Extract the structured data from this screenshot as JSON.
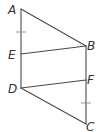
{
  "diagram": {
    "type": "geometry",
    "points": {
      "A": {
        "label": "A",
        "x": 21,
        "y": 9
      },
      "B": {
        "label": "B",
        "x": 86,
        "y": 46
      },
      "C": {
        "label": "C",
        "x": 86,
        "y": 124
      },
      "D": {
        "label": "D",
        "x": 21,
        "y": 88
      },
      "E": {
        "label": "E",
        "x": 21,
        "y": 54
      },
      "F": {
        "label": "F",
        "x": 86,
        "y": 80
      }
    },
    "segments": [
      [
        "A",
        "B"
      ],
      [
        "A",
        "D"
      ],
      [
        "B",
        "C"
      ],
      [
        "E",
        "B"
      ],
      [
        "D",
        "F"
      ],
      [
        "D",
        "C"
      ]
    ],
    "tick_marks": [
      {
        "segment": "AE",
        "count": 1
      },
      {
        "segment": "FC",
        "count": 1
      }
    ],
    "colors": {
      "line": "#4a4a4a",
      "tick": "#8a8a8a",
      "label": "#333333"
    }
  }
}
